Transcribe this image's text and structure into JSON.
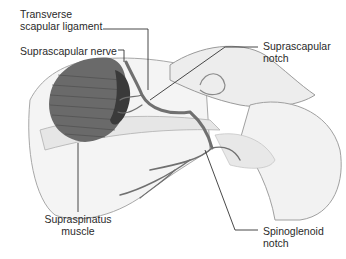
{
  "diagram": {
    "labels": {
      "transverse_ligament_line1": "Transverse",
      "transverse_ligament_line2": "scapular ligament",
      "suprascapular_nerve": "Suprascapular nerve",
      "suprascapular_notch_line1": "Suprascapular",
      "suprascapular_notch_line2": "notch",
      "supraspinatus_line1": "Supraspinatus",
      "supraspinatus_line2": "muscle",
      "spinoglenoid_line1": "Spinoglenoid",
      "spinoglenoid_line2": "notch"
    },
    "colors": {
      "muscle": "#5a5a5a",
      "bone_outline": "#9a9a9a",
      "nerve": "#6e6e6e",
      "leader_line": "#333333",
      "text": "#2a2a2a"
    }
  }
}
